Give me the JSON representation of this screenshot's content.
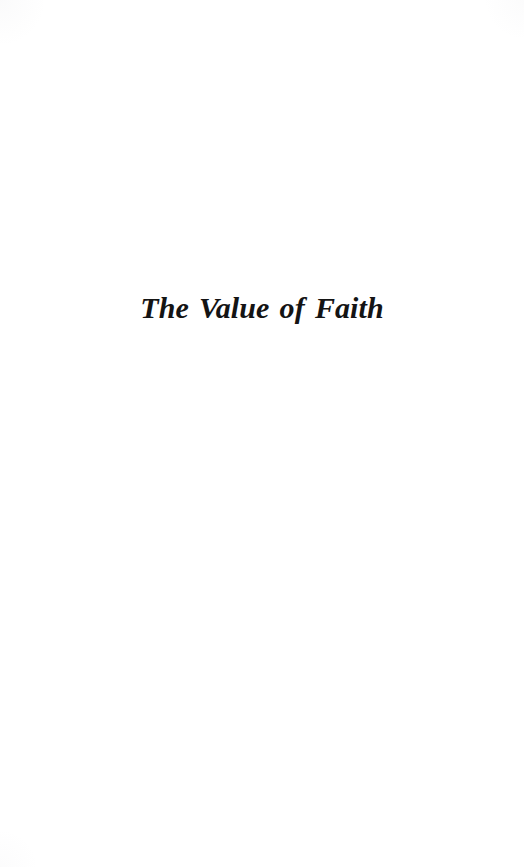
{
  "page": {
    "kind": "scanned-book-section-title-page",
    "background_color": "#ffffff",
    "ink_color": "#141414",
    "width": 524,
    "height": 867
  },
  "content": {
    "section_title": "The Value of Faith"
  }
}
